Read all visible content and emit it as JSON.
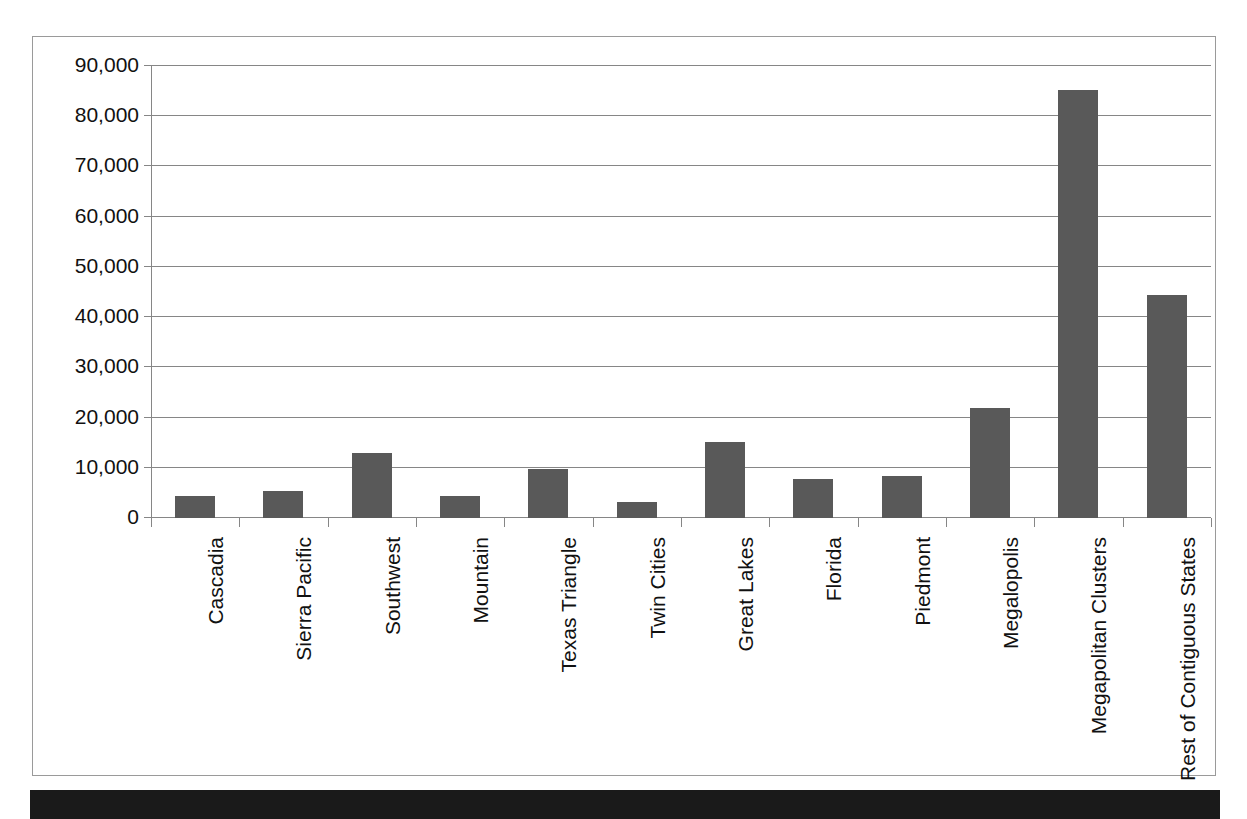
{
  "chart_data": {
    "type": "bar",
    "title": "",
    "xlabel": "",
    "ylabel": "",
    "ylim": [
      0,
      90000
    ],
    "ytick_labels": [
      "90,000",
      "80,000",
      "70,000",
      "60,000",
      "50,000",
      "40,000",
      "30,000",
      "20,000",
      "10,000",
      "0"
    ],
    "ytick_values": [
      90000,
      80000,
      70000,
      60000,
      50000,
      40000,
      30000,
      20000,
      10000,
      0
    ],
    "grid": true,
    "legend": "none",
    "series_color": "#595959",
    "categories": [
      "Cascadia",
      "Sierra Pacific",
      "Southwest",
      "Mountain",
      "Texas Triangle",
      "Twin Cities",
      "Great Lakes",
      "Florida",
      "Piedmont",
      "Megalopolis",
      "Megapolitan Clusters",
      "Rest of Contiguous States"
    ],
    "values": [
      4400,
      5400,
      12900,
      4400,
      9800,
      3100,
      15200,
      7800,
      8300,
      22000,
      85200,
      44500
    ]
  },
  "footer": {
    "band_text": ""
  }
}
